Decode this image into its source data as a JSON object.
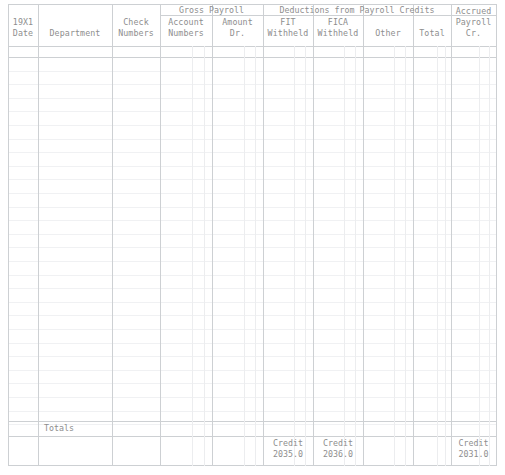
{
  "document": {
    "type": "payroll-register-ledger",
    "period_label": "19X1"
  },
  "header": {
    "groups": [
      {
        "label": "Gross Payroll"
      },
      {
        "label": "Deductions from Payroll Credits"
      }
    ],
    "columns": [
      {
        "id": "date",
        "line1": "19X1",
        "line2": "Date"
      },
      {
        "id": "dept",
        "line1": "",
        "line2": "Department"
      },
      {
        "id": "check",
        "line1": "Check",
        "line2": "Numbers"
      },
      {
        "id": "acctnum",
        "line1": "Account",
        "line2": "Numbers"
      },
      {
        "id": "amount",
        "line1": "Amount",
        "line2": "Dr."
      },
      {
        "id": "fit",
        "line1": "FIT",
        "line2": "Withheld"
      },
      {
        "id": "fica",
        "line1": "FICA",
        "line2": "Withheld"
      },
      {
        "id": "other",
        "line1": "",
        "line2": "Other"
      },
      {
        "id": "total",
        "line1": "",
        "line2": "Total"
      },
      {
        "id": "accrued",
        "line1": "Accrued",
        "line2": "Payroll",
        "line3": "Cr."
      }
    ]
  },
  "body": {
    "totals_label": "Totals",
    "row_count": 27
  },
  "footer": {
    "credits": [
      {
        "column": "fit",
        "label": "Credit",
        "value": "2035.0"
      },
      {
        "column": "fica",
        "label": "Credit",
        "value": "2036.0"
      },
      {
        "column": "accrued",
        "label": "Credit",
        "value": "2031.0"
      }
    ]
  },
  "colors": {
    "text": "#8e8e8e",
    "rule_major": "#cdd0d3",
    "rule_minor": "#eceef0",
    "background": "#ffffff"
  }
}
